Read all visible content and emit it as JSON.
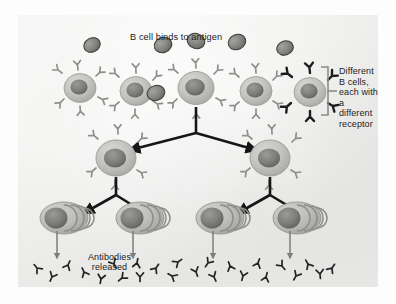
{
  "figure": {
    "background_color": "#ececea",
    "page_color": "#fdfdfd"
  },
  "labels": {
    "binds_to_antigen": "B cell binds to antigen",
    "different_b_cells": "Different\nB cells,\neach with\na different\nreceptor",
    "antibodies_released": "Antibodies\nreleased"
  },
  "colors": {
    "cell_body_light": "#c9c9c6",
    "cell_body_mid": "#b4b4b1",
    "nucleus_dark": "#6f6f6d",
    "receptor_gray": "#8e8e8b",
    "receptor_black": "#1d1d1d",
    "antigen_fill": "#8a8a88",
    "antigen_stroke": "#3a3a38",
    "arrow_black": "#161616",
    "arrow_thin_gray": "#7d7d7b",
    "bracket_gray": "#8b8b89",
    "antibody_dark": "#232323",
    "text": "#1c1c1c"
  },
  "diagram": {
    "top_row_label": "Different B cells each with a different receptor",
    "b_cells_top_row": [
      {
        "id": "b-cell-1",
        "cx": 62,
        "cy": 73,
        "r": 15,
        "receptor_color": "gray",
        "selected": false,
        "antigen_bound": false
      },
      {
        "id": "b-cell-2",
        "cx": 118,
        "cy": 76,
        "r": 15,
        "receptor_color": "gray",
        "selected": false,
        "antigen_bound": false
      },
      {
        "id": "b-cell-3",
        "cx": 178,
        "cy": 73,
        "r": 17,
        "receptor_color": "gray",
        "selected": true,
        "antigen_bound": true
      },
      {
        "id": "b-cell-4",
        "cx": 238,
        "cy": 76,
        "r": 15,
        "receptor_color": "gray",
        "selected": false,
        "antigen_bound": false
      },
      {
        "id": "b-cell-5",
        "cx": 292,
        "cy": 77,
        "r": 15,
        "receptor_color": "black",
        "selected": false,
        "antigen_bound": false
      }
    ],
    "free_antigens": [
      {
        "id": "antigen-1",
        "cx": 92,
        "cy": 45,
        "rx": 8.5,
        "ry": 7,
        "rot": -28
      },
      {
        "id": "antigen-2",
        "cx": 163,
        "cy": 45,
        "rx": 9,
        "ry": 7.5,
        "rot": -22
      },
      {
        "id": "antigen-3",
        "cx": 196,
        "cy": 41,
        "rx": 9,
        "ry": 7.5,
        "rot": 18
      },
      {
        "id": "antigen-4",
        "cx": 156,
        "cy": 93,
        "rx": 9,
        "ry": 7.5,
        "rot": -18
      },
      {
        "id": "antigen-5",
        "cx": 237,
        "cy": 42,
        "rx": 9,
        "ry": 7.5,
        "rot": -25
      },
      {
        "id": "antigen-6",
        "cx": 285,
        "cy": 48,
        "rx": 8.5,
        "ry": 7,
        "rot": -20
      }
    ],
    "daughter_cells": [
      {
        "id": "daughter-cell-left",
        "cx": 98,
        "cy": 143,
        "r": 19
      },
      {
        "id": "daughter-cell-right",
        "cx": 252,
        "cy": 143,
        "r": 19
      }
    ],
    "plasma_cells": [
      {
        "id": "plasma-cell-1",
        "cx": 57,
        "cy": 218
      },
      {
        "id": "plasma-cell-2",
        "cx": 133,
        "cy": 218
      },
      {
        "id": "plasma-cell-3",
        "cx": 213,
        "cy": 218
      },
      {
        "id": "plasma-cell-4",
        "cx": 290,
        "cy": 218
      }
    ],
    "division_arrows": {
      "generation_1": {
        "from": "b-cell-3",
        "to": [
          "daughter-cell-left",
          "daughter-cell-right"
        ]
      },
      "generation_2_left": {
        "from": "daughter-cell-left",
        "to": [
          "plasma-cell-1",
          "plasma-cell-2"
        ]
      },
      "generation_2_right": {
        "from": "daughter-cell-right",
        "to": [
          "plasma-cell-3",
          "plasma-cell-4"
        ]
      }
    },
    "secretion_arrows": [
      {
        "id": "secretion-arrow-1",
        "x": 57
      },
      {
        "id": "secretion-arrow-2",
        "x": 133
      },
      {
        "id": "secretion-arrow-3",
        "x": 213
      },
      {
        "id": "secretion-arrow-4",
        "x": 290
      }
    ],
    "antibodies": [
      {
        "cx": 37,
        "cy": 268,
        "rot": 140
      },
      {
        "cx": 52,
        "cy": 277,
        "rot": 25
      },
      {
        "cx": 68,
        "cy": 265,
        "rot": 205
      },
      {
        "cx": 84,
        "cy": 272,
        "rot": 155
      },
      {
        "cx": 101,
        "cy": 279,
        "rot": 10
      },
      {
        "cx": 114,
        "cy": 264,
        "rot": 330
      },
      {
        "cx": 122,
        "cy": 278,
        "rot": 50
      },
      {
        "cx": 137,
        "cy": 263,
        "rot": 190
      },
      {
        "cx": 140,
        "cy": 277,
        "rot": 0
      },
      {
        "cx": 156,
        "cy": 268,
        "rot": 215
      },
      {
        "cx": 172,
        "cy": 276,
        "rot": 120
      },
      {
        "cx": 178,
        "cy": 262,
        "rot": 235
      },
      {
        "cx": 196,
        "cy": 272,
        "rot": 340
      },
      {
        "cx": 208,
        "cy": 263,
        "rot": 35
      },
      {
        "cx": 214,
        "cy": 277,
        "rot": 335
      },
      {
        "cx": 230,
        "cy": 266,
        "rot": 160
      },
      {
        "cx": 243,
        "cy": 276,
        "rot": 15
      },
      {
        "cx": 258,
        "cy": 263,
        "rot": 200
      },
      {
        "cx": 266,
        "cy": 277,
        "rot": 195
      },
      {
        "cx": 282,
        "cy": 266,
        "rot": 320
      },
      {
        "cx": 296,
        "cy": 276,
        "rot": 30
      },
      {
        "cx": 308,
        "cy": 264,
        "rot": 150
      },
      {
        "cx": 320,
        "cy": 274,
        "rot": 355
      },
      {
        "cx": 332,
        "cy": 268,
        "rot": 215
      }
    ],
    "bracket": {
      "x": 308,
      "y_top": 52,
      "y_bottom": 100
    }
  }
}
